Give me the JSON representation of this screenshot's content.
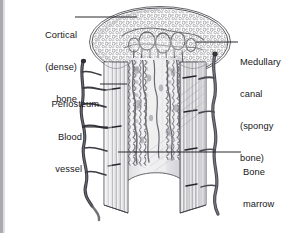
{
  "figure": {
    "background_color": "#ffffff",
    "ink_color": "#17171a",
    "label_font_size_px": 9.3
  },
  "labels": {
    "cortical": {
      "name": "cortical-bone",
      "lines": [
        "Cortical",
        "(dense)",
        "bone"
      ],
      "line1": "Cortical",
      "line2": "(dense)",
      "line3": "bone",
      "align": "right",
      "leader_from": [
        75,
        17
      ],
      "leader_to": [
        137,
        17
      ]
    },
    "periosteum": {
      "name": "periosteum",
      "lines": [
        "Periosteum"
      ],
      "line1": "Periosteum",
      "align": "right",
      "leader_from": [
        100,
        84
      ],
      "leader_to": [
        127,
        84
      ]
    },
    "blood_vessel": {
      "name": "blood-vessel",
      "lines": [
        "Blood",
        "vessel"
      ],
      "line1": "Blood",
      "line2": "vessel",
      "align": "right",
      "leader_from": [
        82,
        127
      ],
      "leader_to": [
        108,
        127
      ]
    },
    "medullary": {
      "name": "medullary-canal",
      "lines": [
        "Medullary",
        "canal",
        "(spongy",
        "bone)"
      ],
      "line1": "Medullary",
      "line2": "canal",
      "line3": "(spongy",
      "line4": "bone)",
      "align": "left",
      "leader_from": [
        196,
        42
      ],
      "leader_to": [
        238,
        42
      ]
    },
    "bone_marrow": {
      "name": "bone-marrow",
      "lines": [
        "Bone",
        "marrow"
      ],
      "line1": "Bone",
      "line2": "marrow",
      "align": "left",
      "leader_from": [
        118,
        152
      ],
      "leader_to": [
        241,
        152
      ]
    }
  },
  "structures": {
    "cap": "spongy-bone-cap",
    "shaft": "cortical-shaft",
    "canal": "medullary-canal-interior",
    "vessel_left": "left-blood-vessel",
    "vessel_right": "right-blood-vessel",
    "edge_bar": "left-page-edge"
  }
}
